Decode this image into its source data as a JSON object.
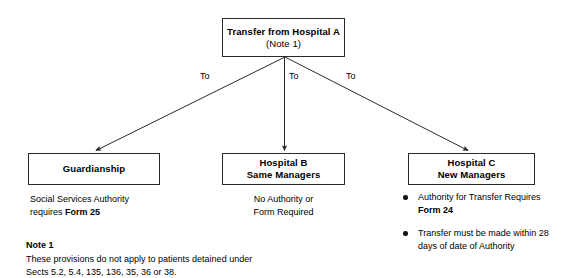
{
  "diagram": {
    "top_node": {
      "title": "Transfer from Hospital A",
      "subtitle": "(Note 1)"
    },
    "edge_labels": {
      "left": "To",
      "middle": "To",
      "right": "To"
    },
    "branches": [
      {
        "key": "guardianship",
        "title": "Guardianship",
        "caption_plain": "Social Services Authority requires ",
        "caption_line1": "Social Services Authority",
        "caption_line2_prefix": "requires ",
        "caption_line2_bold": "Form 25"
      },
      {
        "key": "hospital_b",
        "title_line1": "Hospital B",
        "title_line2": "Same Managers",
        "caption_line1": "No Authority or",
        "caption_line2": "Form Required"
      },
      {
        "key": "hospital_c",
        "title_line1": "Hospital C",
        "title_line2": "New Managers",
        "bullets": [
          {
            "text_before": "Authority for Transfer Requires ",
            "text_bold": "Form 24",
            "text_after": ""
          },
          {
            "text_before": "Transfer must be made within 28 days of date of Authority",
            "text_bold": "",
            "text_after": ""
          }
        ]
      }
    ],
    "note": {
      "title": "Note 1",
      "line1": "These provisions do not apply to patients detained under",
      "line2": "Sects 5.2, 5.4, 135, 136, 35, 36 or 38."
    },
    "colors": {
      "background": "#ffffff",
      "stroke": "#2a2a2a",
      "text": "#000000",
      "bullet": "#111111"
    }
  }
}
